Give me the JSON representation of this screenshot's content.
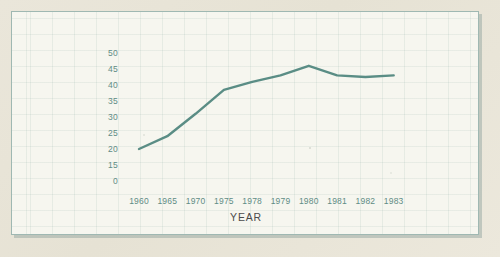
{
  "figure": {
    "background_color": "#e9e5d9",
    "panel_color": "#f6f6ef",
    "border_color": "#9fb8b2",
    "line_color": "#5a8d85",
    "tick_label_color": "#5f8c85",
    "axis_title_color": "#4b4b4b"
  },
  "chart_data": {
    "type": "line",
    "title": "",
    "xlabel": "YEAR",
    "ylabel": "",
    "categories": [
      "1960",
      "1965",
      "1970",
      "1975",
      "1978",
      "1979",
      "1980",
      "1981",
      "1982",
      "1983"
    ],
    "values": [
      20,
      24,
      31,
      38.5,
      41,
      43,
      46,
      43,
      42.5,
      43
    ],
    "series": [
      {
        "name": "",
        "values": [
          20,
          24,
          31,
          38.5,
          41,
          43,
          46,
          43,
          42.5,
          43
        ]
      }
    ],
    "ytick_labels": [
      "50",
      "45",
      "40",
      "35",
      "30",
      "25",
      "20",
      "15",
      "0"
    ],
    "ytick_values": [
      50,
      45,
      40,
      35,
      30,
      25,
      20,
      15,
      0
    ],
    "ytick_spacing_uniform": true,
    "ylim": [
      0,
      50
    ],
    "xtick_labels": [
      "1960",
      "1965",
      "1970",
      "1975",
      "1978",
      "1979",
      "1980",
      "1981",
      "1982",
      "1983"
    ],
    "grid": true,
    "grid_style": "faint graph paper",
    "legend": null,
    "legend_position": "none",
    "markers": false,
    "annotations": []
  }
}
